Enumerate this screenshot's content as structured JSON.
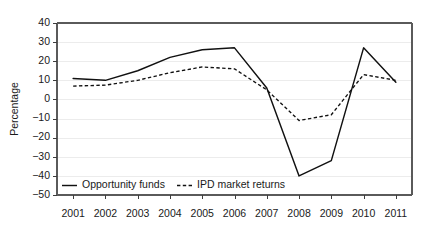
{
  "chart_data": {
    "type": "line",
    "title": "",
    "subtitle": "",
    "xlabel": "",
    "ylabel": "Percentage",
    "x": [
      "2001",
      "2002",
      "2003",
      "2004",
      "2005",
      "2006",
      "2007",
      "2008",
      "2009",
      "2010",
      "2011"
    ],
    "categories": [
      "2001",
      "2002",
      "2003",
      "2004",
      "2005",
      "2006",
      "2007",
      "2008",
      "2009",
      "2010",
      "2011"
    ],
    "series": [
      {
        "name": "Opportunity funds",
        "style": "solid",
        "color": "#111111",
        "values": [
          11,
          10,
          15,
          22,
          26,
          27,
          6,
          -40,
          -32,
          27,
          9
        ]
      },
      {
        "name": "IPD market returns",
        "style": "dashed",
        "color": "#111111",
        "values": [
          7,
          7.5,
          10,
          14,
          17,
          16,
          5,
          -11,
          -8,
          13,
          10
        ]
      }
    ],
    "ylim": [
      -50,
      40
    ],
    "yticks": [
      40,
      30,
      20,
      10,
      0,
      -10,
      -20,
      -30,
      -40,
      -50
    ],
    "ytick_labels": [
      "40",
      "30",
      "20",
      "10",
      "0",
      "−10",
      "−20",
      "−30",
      "−40",
      "−50"
    ],
    "xtick_labels": [
      "2001",
      "2002",
      "2003",
      "2004",
      "2005",
      "2006",
      "2007",
      "2008",
      "2009",
      "2010",
      "2011"
    ],
    "grid": true,
    "grid_axis": "y",
    "grid_color": "#ececec",
    "legend_position": "inside-bottom-left",
    "legend_entries": [
      {
        "label": "Opportunity funds",
        "style": "solid"
      },
      {
        "label": "IPD market returns",
        "style": "dashed"
      }
    ]
  },
  "axes": {
    "y_axis_title": "Percentage"
  },
  "legend": {
    "opportunity_funds_label": "Opportunity funds",
    "ipd_market_returns_label": "IPD market returns"
  }
}
